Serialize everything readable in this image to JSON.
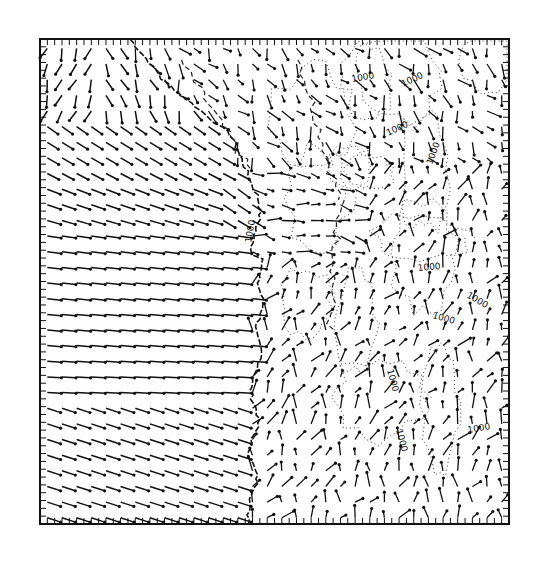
{
  "map": {
    "type": "wind-vector-field",
    "frame": {
      "x0": 40,
      "y0": 39,
      "x1": 509,
      "y1": 524
    },
    "grid": {
      "cols": 32,
      "rows": 31
    },
    "coastline_color": "#111111",
    "vector_color": "#111111",
    "contour_color": "#333333",
    "contour_labels": [
      {
        "text": "1000",
        "x": 352,
        "y": 82,
        "angle": -10
      },
      {
        "text": "1000",
        "x": 403,
        "y": 87,
        "angle": -25
      },
      {
        "text": "1000",
        "x": 388,
        "y": 136,
        "angle": -25
      },
      {
        "text": "1000",
        "x": 432,
        "y": 165,
        "angle": -70
      },
      {
        "text": "1000",
        "x": 251,
        "y": 243,
        "angle": -80
      },
      {
        "text": "1000",
        "x": 418,
        "y": 271,
        "angle": -5
      },
      {
        "text": "1000",
        "x": 466,
        "y": 297,
        "angle": 30
      },
      {
        "text": "1000",
        "x": 432,
        "y": 318,
        "angle": 15
      },
      {
        "text": "1000",
        "x": 387,
        "y": 370,
        "angle": 75
      },
      {
        "text": "1000",
        "x": 396,
        "y": 430,
        "angle": 75
      },
      {
        "text": "1000",
        "x": 468,
        "y": 433,
        "angle": -10
      }
    ]
  }
}
